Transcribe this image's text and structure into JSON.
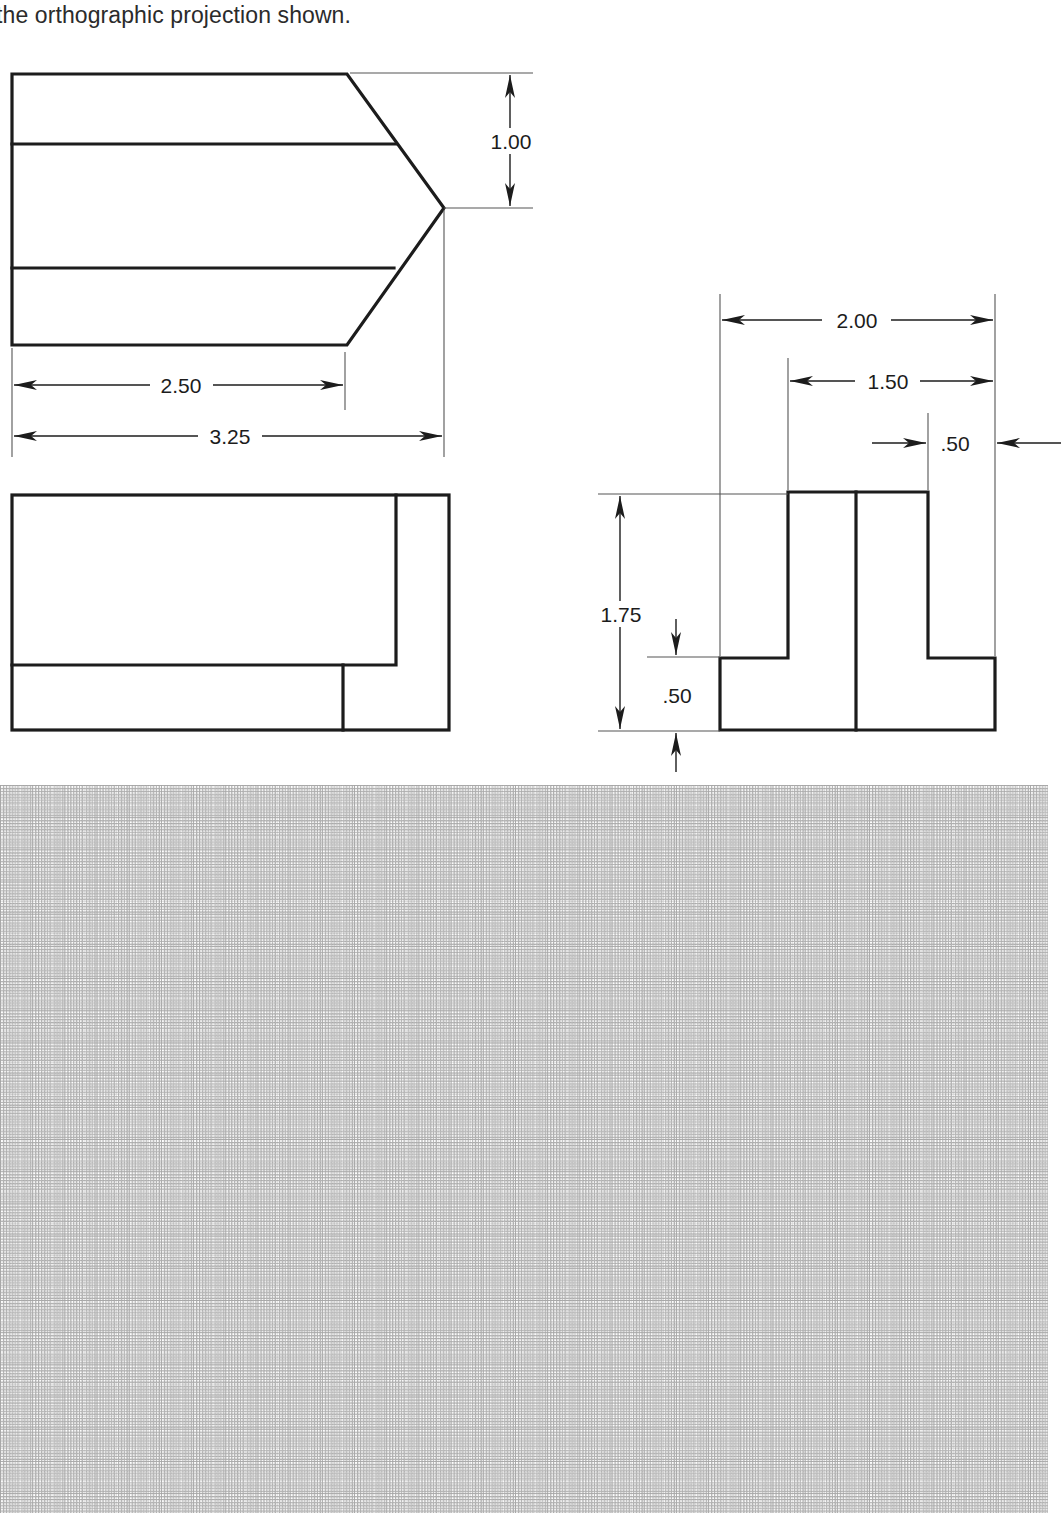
{
  "page": {
    "prompt": "the orthographic projection shown.",
    "background_color": "#ffffff",
    "line_color": "#1c1c1c",
    "thin_line_color": "#555555",
    "grid_color": "#9a9a9a"
  },
  "drawing": {
    "type": "orthographic-projection",
    "title": "the orthographic projection shown.",
    "views": [
      {
        "name": "top-view",
        "shape": "pointed-block-outline",
        "dimensions": [
          "2.50",
          "3.25",
          "1.00"
        ]
      },
      {
        "name": "front-view",
        "shape": "stepped-rectangle",
        "dimensions": []
      },
      {
        "name": "right-side-view",
        "shape": "tee-profile",
        "dimensions": [
          "2.00",
          "1.50",
          ".50",
          "1.75",
          ".50"
        ]
      }
    ]
  },
  "dimensions": {
    "top_view_vertical": "1.00",
    "top_view_partial_length": "2.50",
    "top_view_overall_length": "3.25",
    "side_view_overall_width": "2.00",
    "side_view_inner_width": "1.50",
    "side_view_rib_width": ".50",
    "side_view_overall_height": "1.75",
    "side_view_base_height": ".50"
  },
  "grid": {
    "label": "dotted-graph-paper",
    "cell_size_px": 32,
    "top_px": 785,
    "width_px": 1048,
    "height_px": 728
  }
}
